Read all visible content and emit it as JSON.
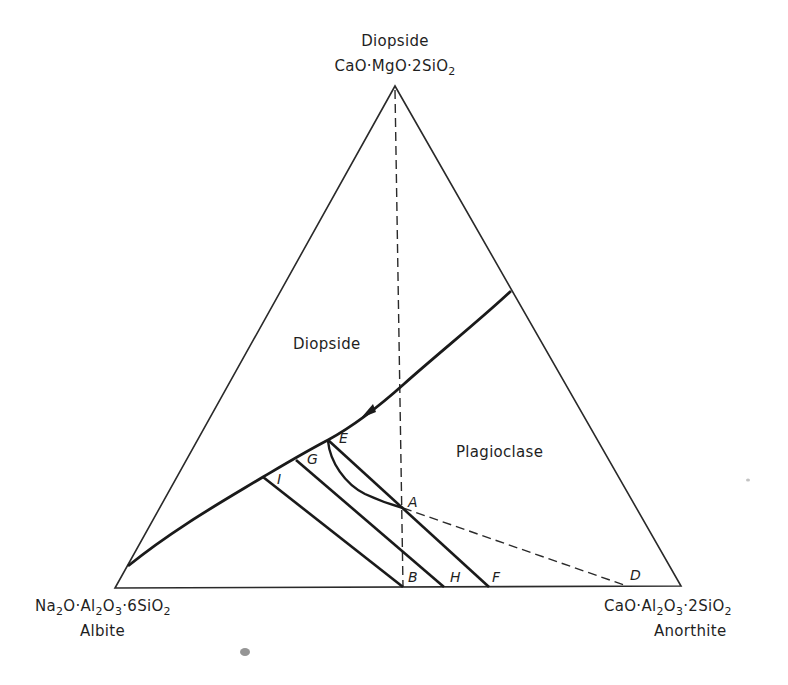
{
  "vertices": {
    "top": {
      "name": "Diopside",
      "formula_parts": [
        "CaO·MgO·2SiO",
        "2"
      ],
      "formula": "CaO·MgO·2SiO2"
    },
    "bottom_left": {
      "name": "Albite",
      "formula_parts": [
        "Na",
        "2",
        "O·Al",
        "2",
        "O",
        "3",
        "·6SiO",
        "2"
      ],
      "formula": "Na2O·Al2O3·6SiO2"
    },
    "bottom_right": {
      "name": "Anorthite",
      "formula_parts": [
        "CaO·Al",
        "2",
        "O",
        "3",
        "·2SiO",
        "2"
      ],
      "formula": "CaO·Al2O3·2SiO2"
    }
  },
  "fields": {
    "diopside": "Diopside",
    "plagioclase": "Plagioclase"
  },
  "points": {
    "A": "A",
    "B": "B",
    "D": "D",
    "E": "E",
    "F": "F",
    "G": "G",
    "H": "H",
    "I": "I"
  },
  "colors": {
    "line": "#1a1a1a",
    "background": "#ffffff"
  }
}
